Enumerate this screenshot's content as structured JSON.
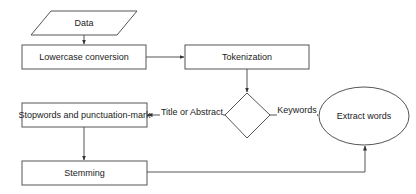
{
  "diagram": {
    "type": "flowchart",
    "nodes": {
      "data": {
        "label": "Data",
        "shape": "parallelogram"
      },
      "lowercase": {
        "label": "Lowercase conversion",
        "shape": "rectangle"
      },
      "tokenization": {
        "label": "Tokenization",
        "shape": "rectangle"
      },
      "decision": {
        "label": "",
        "shape": "diamond"
      },
      "stopwords": {
        "label": "Stopwords and punctuation-mark",
        "shape": "rectangle"
      },
      "stemming": {
        "label": "Stemming",
        "shape": "rectangle"
      },
      "extract": {
        "label": "Extract words",
        "shape": "ellipse"
      }
    },
    "edges": {
      "data_to_lowercase": {
        "from": "Data",
        "to": "Lowercase conversion",
        "label": ""
      },
      "lowercase_to_tokenization": {
        "from": "Lowercase conversion",
        "to": "Tokenization",
        "label": ""
      },
      "tokenization_to_decision": {
        "from": "Tokenization",
        "to": "decision",
        "label": ""
      },
      "decision_to_stopwords": {
        "from": "decision",
        "to": "Stopwords and punctuation-mark",
        "label": "Title or Abstract"
      },
      "decision_to_extract": {
        "from": "decision",
        "to": "Extract words",
        "label": "Keywords"
      },
      "stopwords_to_stemming": {
        "from": "Stopwords and punctuation-mark",
        "to": "Stemming",
        "label": ""
      },
      "stemming_to_extract": {
        "from": "Stemming",
        "to": "Extract words",
        "label": ""
      }
    },
    "colors": {
      "stroke": "#555555",
      "text": "#222222",
      "background": "#ffffff"
    }
  }
}
